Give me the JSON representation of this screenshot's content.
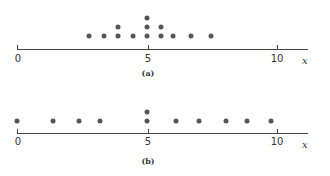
{
  "chart_data": [
    {
      "type": "scatter",
      "subtype": "dot-plot",
      "title": "",
      "caption": "(a)",
      "xlabel": "x",
      "ylabel": "",
      "xlim": [
        0,
        11.5
      ],
      "xticks": [
        0,
        5,
        10
      ],
      "xtick_labels": [
        "0",
        "5",
        "10"
      ],
      "grid": false,
      "points": [
        {
          "x": 2.75,
          "stack": 1
        },
        {
          "x": 3.35,
          "stack": 1
        },
        {
          "x": 3.9,
          "stack": 2
        },
        {
          "x": 4.45,
          "stack": 1
        },
        {
          "x": 5.0,
          "stack": 3
        },
        {
          "x": 5.55,
          "stack": 2
        },
        {
          "x": 6.0,
          "stack": 1
        },
        {
          "x": 6.7,
          "stack": 1
        },
        {
          "x": 7.45,
          "stack": 1
        }
      ]
    },
    {
      "type": "scatter",
      "subtype": "dot-plot",
      "title": "",
      "caption": "(b)",
      "xlabel": "x",
      "ylabel": "",
      "xlim": [
        0,
        11.5
      ],
      "xticks": [
        0,
        5,
        10
      ],
      "xtick_labels": [
        "0",
        "5",
        "10"
      ],
      "grid": false,
      "points": [
        {
          "x": 0.0,
          "stack": 1
        },
        {
          "x": 1.4,
          "stack": 1
        },
        {
          "x": 2.4,
          "stack": 1
        },
        {
          "x": 3.2,
          "stack": 1
        },
        {
          "x": 5.0,
          "stack": 2
        },
        {
          "x": 6.1,
          "stack": 1
        },
        {
          "x": 7.0,
          "stack": 1
        },
        {
          "x": 8.05,
          "stack": 1
        },
        {
          "x": 8.85,
          "stack": 1
        },
        {
          "x": 9.75,
          "stack": 1
        }
      ]
    }
  ],
  "panels": {
    "a": {
      "caption": "(a)",
      "xlabel": "x",
      "ticks": [
        "0",
        "5",
        "10"
      ]
    },
    "b": {
      "caption": "(b)",
      "xlabel": "x",
      "ticks": [
        "0",
        "5",
        "10"
      ]
    }
  }
}
